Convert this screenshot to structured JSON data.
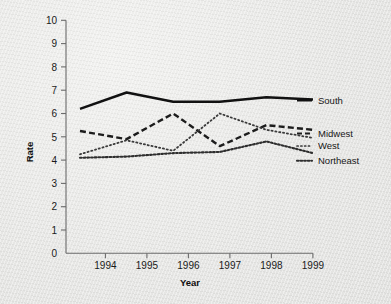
{
  "chart_data": {
    "type": "line",
    "title": "",
    "xlabel": "Year",
    "ylabel": "Rate",
    "x": [
      1994,
      1995,
      1996,
      1997,
      1998,
      1999
    ],
    "xlim": [
      1993.7,
      1999.0
    ],
    "ylim": [
      0,
      10
    ],
    "yticks": [
      0,
      1,
      2,
      3,
      4,
      5,
      6,
      7,
      8,
      9,
      10
    ],
    "xticks": [
      1994,
      1995,
      1996,
      1997,
      1998,
      1999
    ],
    "xtick_labels": [
      "1994",
      "1995",
      "1996",
      "1997",
      "1998",
      "1999"
    ],
    "ytick_labels": [
      "0",
      "1",
      "2",
      "3",
      "4",
      "5",
      "6",
      "7",
      "8",
      "9",
      "10"
    ],
    "grid": false,
    "legend_position": "right-of-line-ends",
    "series": [
      {
        "name": "South",
        "style": "solid",
        "color": "#111111",
        "values": [
          6.2,
          6.9,
          6.5,
          6.5,
          6.7,
          6.6
        ],
        "label": "South"
      },
      {
        "name": "Midwest",
        "style": "dashed",
        "color": "#1c1c1c",
        "values": [
          5.25,
          4.9,
          6.0,
          4.6,
          5.5,
          5.3
        ],
        "label": "Midwest"
      },
      {
        "name": "West",
        "style": "dotted-fine",
        "color": "#3a3a3a",
        "values": [
          4.25,
          4.85,
          4.4,
          6.0,
          5.3,
          4.95
        ],
        "label": "West"
      },
      {
        "name": "Northeast",
        "style": "dotted-dense",
        "color": "#2e2e2e",
        "values": [
          4.1,
          4.15,
          4.3,
          4.35,
          4.8,
          4.3
        ],
        "label": "Northeast"
      }
    ]
  },
  "axes": {
    "y_title": "Rate",
    "x_title": "Year"
  },
  "labels": {
    "south": "South",
    "midwest": "Midwest",
    "west": "West",
    "northeast": "Northeast"
  },
  "ticks": {
    "y": [
      "10",
      "9",
      "8",
      "7",
      "6",
      "5",
      "4",
      "3",
      "2",
      "1",
      "0"
    ],
    "x": [
      "1994",
      "1995",
      "1996",
      "1997",
      "1998",
      "1999"
    ]
  },
  "colors": {
    "background": "#e8e8e6",
    "axis": "#6b6b6b",
    "ink": "#111111"
  }
}
